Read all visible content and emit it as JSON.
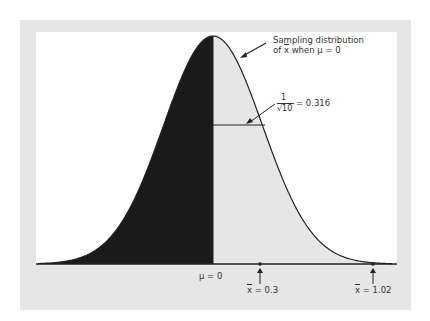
{
  "chart_data": {
    "type": "area",
    "title": "",
    "mean": 0,
    "std_dev": 0.316,
    "x_range": [
      -1.1,
      1.1
    ],
    "shaded_regions": [
      {
        "from": -1.1,
        "to": 0,
        "color": "#1a1a1a"
      },
      {
        "from": 0,
        "to": 1.1,
        "color": "#e6e6e6"
      }
    ],
    "annotations": [
      {
        "text": "Sampling distribution of x̄ when μ = 0",
        "points_to": "curve"
      },
      {
        "text": "1/√10 = 0.316",
        "points_to": "standard deviation bar"
      },
      {
        "text": "μ = 0",
        "x": 0
      },
      {
        "text": "x̄ = 0.3",
        "x": 0.3,
        "marker": "arrow"
      },
      {
        "text": "x̄ = 1.02",
        "x": 1.02,
        "marker": "arrow"
      }
    ],
    "xlabel": "",
    "ylabel": ""
  },
  "labels": {
    "curve_label_line1": "Sampling distribution",
    "curve_label_line2_pre": "of ",
    "curve_label_xbar": "x",
    "curve_label_line2_post": " when μ = 0",
    "sd_num": "1",
    "sd_den": "√10",
    "sd_eq": "= 0.316",
    "mu_label": "μ = 0",
    "xbar1_sym": "x",
    "xbar1_val": " = 0.3",
    "xbar2_sym": "x",
    "xbar2_val": " = 1.02"
  },
  "colors": {
    "dark_fill": "#1a1a1a",
    "light_fill": "#e6e6e6",
    "frame": "#e6e6e6",
    "line": "#222222"
  }
}
